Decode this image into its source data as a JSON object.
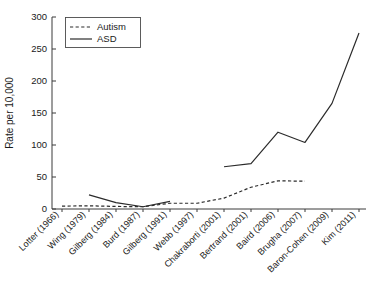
{
  "chart_data": {
    "type": "line",
    "title": "",
    "subtitle": "",
    "xlabel": "",
    "ylabel": "Rate per 10,000",
    "ylim": [
      0,
      300
    ],
    "yticks": [
      0,
      50,
      100,
      150,
      200,
      250,
      300
    ],
    "ytick_labels": [
      "0",
      "50",
      "100",
      "150",
      "200",
      "250",
      "300"
    ],
    "grid": false,
    "legend_position": "top-left",
    "categories": [
      "Lotter (1966)",
      "Wing (1979)",
      "Gilberg (1984)",
      "Burd (1987)",
      "Gilberg (1991)",
      "Webb (1997)",
      "Chakraborti (2001)",
      "Bertrand (2001)",
      "Baird (2006)",
      "Brugha (2007)",
      "Baron-Cohen (2009)",
      "Kim (2011)"
    ],
    "series": [
      {
        "name": "Autism",
        "style": "dashed",
        "color": "#2b2b2b",
        "values": [
          4.5,
          5.0,
          4.0,
          3.5,
          9.0,
          9.0,
          17.0,
          34.0,
          44.0,
          43.5,
          null,
          null
        ]
      },
      {
        "name": "ASD",
        "style": "solid",
        "color": "#2b2b2b",
        "values": [
          null,
          22.0,
          10.0,
          3.5,
          12.0,
          null,
          66.0,
          71.0,
          120.0,
          104.0,
          165.0,
          275.0
        ]
      }
    ]
  },
  "legend": {
    "entries": [
      {
        "label": "Autism",
        "style": "dashed"
      },
      {
        "label": "ASD",
        "style": "solid"
      }
    ]
  },
  "axes": {
    "y_title": "Rate per 10,000"
  }
}
